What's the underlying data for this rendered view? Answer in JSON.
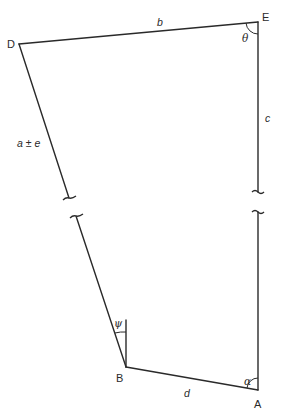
{
  "diagram": {
    "type": "survey traverse / quadrilateral with broken sides",
    "vertices": {
      "D": {
        "label": "D",
        "x": 19,
        "y": 44
      },
      "E": {
        "label": "E",
        "x": 258,
        "y": 22
      },
      "A": {
        "label": "A",
        "x": 258,
        "y": 390
      },
      "B": {
        "label": "B",
        "x": 126,
        "y": 367
      }
    },
    "sides": {
      "b": {
        "label": "b",
        "from": "D",
        "to": "E"
      },
      "c": {
        "label": "c",
        "from": "E",
        "to": "A",
        "broken": true
      },
      "a": {
        "label": "a ± e",
        "from": "D",
        "to": "B",
        "broken": true
      },
      "d": {
        "label": "d",
        "from": "B",
        "to": "A"
      }
    },
    "angles": {
      "theta": {
        "label": "θ",
        "at": "E"
      },
      "alpha": {
        "label": "α",
        "at": "A"
      },
      "psi": {
        "label": "ψ",
        "at": "B",
        "note": "angle between side BD and vertical reference line"
      }
    },
    "colors": {
      "line": "#2a2a2a",
      "background": "#ffffff"
    }
  }
}
